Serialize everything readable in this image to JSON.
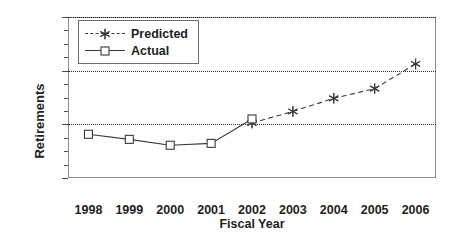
{
  "chart_data": {
    "type": "line",
    "title": "",
    "xlabel": "Fiscal Year",
    "ylabel": "Retirements",
    "categories": [
      "1998",
      "1999",
      "2000",
      "2001",
      "2002",
      "2003",
      "2004",
      "2005",
      "2006"
    ],
    "ylim": [
      0,
      600
    ],
    "yticks": [
      0,
      200,
      400,
      600
    ],
    "ytick_labels": [
      "0",
      "200",
      "400",
      "600"
    ],
    "y_minor_tick_step": 50,
    "grid": "horizontal-dotted",
    "legend_position": "top-left-inside",
    "series": [
      {
        "name": "Predicted",
        "marker": "star",
        "linestyle": "dashed",
        "color": "#3a3a3a",
        "x": [
          "2002",
          "2003",
          "2004",
          "2005",
          "2006"
        ],
        "values": [
          205,
          248,
          297,
          333,
          425
        ]
      },
      {
        "name": "Actual",
        "marker": "square",
        "linestyle": "solid",
        "color": "#3a3a3a",
        "x": [
          "1998",
          "1999",
          "2000",
          "2001",
          "2002"
        ],
        "values": [
          163,
          144,
          122,
          129,
          220
        ]
      }
    ],
    "legend": [
      {
        "label": "Predicted",
        "marker": "star",
        "linestyle": "dashed"
      },
      {
        "label": "Actual",
        "marker": "square",
        "linestyle": "solid"
      }
    ]
  }
}
